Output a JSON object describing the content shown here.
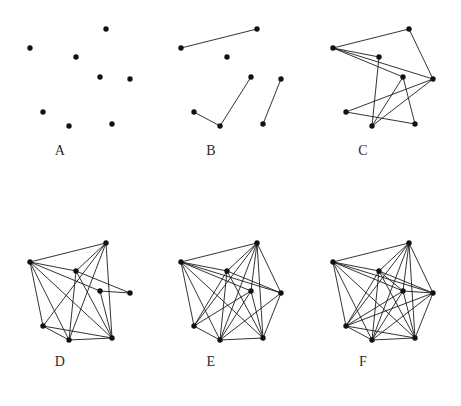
{
  "figure": {
    "background_color": "#ffffff",
    "ink_color": "#121212",
    "node_count": 8,
    "node_radius": 2.7,
    "edge_width": 0.9,
    "node_positions": [
      {
        "id": 0,
        "x": 96,
        "y": 14
      },
      {
        "id": 1,
        "x": 20,
        "y": 33
      },
      {
        "id": 2,
        "x": 66,
        "y": 42
      },
      {
        "id": 3,
        "x": 90,
        "y": 62
      },
      {
        "id": 4,
        "x": 120,
        "y": 64
      },
      {
        "id": 5,
        "x": 33,
        "y": 97
      },
      {
        "id": 6,
        "x": 59,
        "y": 111
      },
      {
        "id": 7,
        "x": 102,
        "y": 109
      }
    ],
    "panels": [
      {
        "label": "A",
        "origin_x": 10,
        "origin_y": 15,
        "label_x": 60,
        "label_y": 150,
        "edge_count": 0,
        "edges": []
      },
      {
        "label": "B",
        "origin_x": 161,
        "origin_y": 15,
        "label_x": 211,
        "label_y": 150,
        "edge_count": 4,
        "edges": [
          [
            1,
            0
          ],
          [
            5,
            6
          ],
          [
            6,
            3
          ],
          [
            7,
            4
          ]
        ]
      },
      {
        "label": "C",
        "origin_x": 313,
        "origin_y": 15,
        "label_x": 363,
        "label_y": 150,
        "edge_count": 11,
        "edges": [
          [
            1,
            0
          ],
          [
            0,
            4
          ],
          [
            1,
            4
          ],
          [
            1,
            3
          ],
          [
            1,
            2
          ],
          [
            2,
            6
          ],
          [
            3,
            6
          ],
          [
            3,
            7
          ],
          [
            5,
            4
          ],
          [
            5,
            7
          ],
          [
            6,
            4
          ]
        ]
      },
      {
        "label": "D",
        "origin_x": 10,
        "origin_y": 229,
        "label_x": 60,
        "label_y": 361,
        "edge_count": 18,
        "edges": [
          [
            0,
            1
          ],
          [
            0,
            2
          ],
          [
            0,
            5
          ],
          [
            0,
            6
          ],
          [
            0,
            7
          ],
          [
            1,
            2
          ],
          [
            1,
            5
          ],
          [
            1,
            6
          ],
          [
            1,
            7
          ],
          [
            1,
            3
          ],
          [
            2,
            4
          ],
          [
            2,
            7
          ],
          [
            2,
            6
          ],
          [
            3,
            7
          ],
          [
            3,
            4
          ],
          [
            5,
            6
          ],
          [
            5,
            7
          ],
          [
            6,
            7
          ]
        ]
      },
      {
        "label": "E",
        "origin_x": 161,
        "origin_y": 229,
        "label_x": 211,
        "label_y": 361,
        "edge_count": 24,
        "edges": [
          [
            0,
            1
          ],
          [
            0,
            2
          ],
          [
            0,
            3
          ],
          [
            0,
            4
          ],
          [
            0,
            5
          ],
          [
            0,
            6
          ],
          [
            0,
            7
          ],
          [
            1,
            2
          ],
          [
            1,
            3
          ],
          [
            1,
            4
          ],
          [
            1,
            5
          ],
          [
            1,
            6
          ],
          [
            1,
            7
          ],
          [
            2,
            4
          ],
          [
            2,
            5
          ],
          [
            2,
            6
          ],
          [
            2,
            7
          ],
          [
            3,
            5
          ],
          [
            3,
            6
          ],
          [
            3,
            7
          ],
          [
            4,
            6
          ],
          [
            4,
            7
          ],
          [
            5,
            6
          ],
          [
            6,
            7
          ]
        ]
      },
      {
        "label": "F",
        "origin_x": 313,
        "origin_y": 229,
        "label_x": 363,
        "label_y": 361,
        "edge_count": 28,
        "edges": [
          [
            0,
            1
          ],
          [
            0,
            2
          ],
          [
            0,
            3
          ],
          [
            0,
            4
          ],
          [
            0,
            5
          ],
          [
            0,
            6
          ],
          [
            0,
            7
          ],
          [
            1,
            2
          ],
          [
            1,
            3
          ],
          [
            1,
            4
          ],
          [
            1,
            5
          ],
          [
            1,
            6
          ],
          [
            1,
            7
          ],
          [
            2,
            3
          ],
          [
            2,
            4
          ],
          [
            2,
            5
          ],
          [
            2,
            6
          ],
          [
            2,
            7
          ],
          [
            3,
            4
          ],
          [
            3,
            5
          ],
          [
            3,
            6
          ],
          [
            3,
            7
          ],
          [
            4,
            5
          ],
          [
            4,
            6
          ],
          [
            4,
            7
          ],
          [
            5,
            6
          ],
          [
            5,
            7
          ],
          [
            6,
            7
          ]
        ]
      }
    ]
  },
  "chart_data": {
    "type": "diagram",
    "subtype": "node-link-graph-grid",
    "grid": {
      "rows": 2,
      "cols": 3
    },
    "shared_vertices": 8,
    "panel_labels": [
      "A",
      "B",
      "C",
      "D",
      "E",
      "F"
    ],
    "edge_counts": [
      0,
      4,
      11,
      18,
      24,
      28
    ],
    "max_possible_edges": 28,
    "densities": [
      0.0,
      0.14,
      0.39,
      0.64,
      0.86,
      1.0
    ],
    "xlabel": "",
    "ylabel": "",
    "legend": [],
    "grid_lines": false
  }
}
